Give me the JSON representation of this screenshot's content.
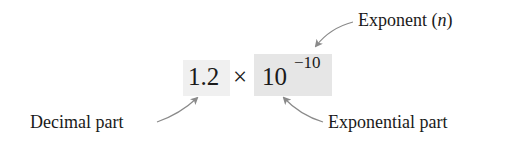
{
  "expression": {
    "mantissa": "1.2",
    "operator": "×",
    "base": "10",
    "exponent": "−10"
  },
  "labels": {
    "exponent_text": "Exponent (",
    "exponent_var": "n",
    "exponent_close": ")",
    "decimal_part": "Decimal part",
    "exponential_part": "Exponential part"
  },
  "colors": {
    "decimal_box": "#f0f0f0",
    "exponential_box": "#e6e6e6",
    "arrow": "#8a8a8a",
    "text": "#1a1a1a"
  }
}
